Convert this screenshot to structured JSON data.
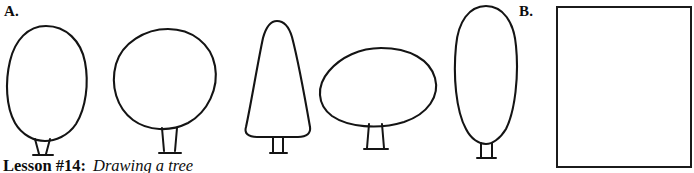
{
  "page": {
    "background_color": "#ffffff",
    "ink_color": "#141414"
  },
  "labels": {
    "part_a": "A.",
    "part_b": "B."
  },
  "caption": {
    "lesson": "Lesson #14:",
    "topic": "Drawing a tree"
  },
  "figure_a": {
    "name": "tree-shape-examples",
    "description": "Five hand-drawn tree canopy shapes with trunks",
    "trees": [
      {
        "id": "tree-1",
        "shape_name": "tall-egg-oval",
        "canopy_center_x": 46,
        "canopy_center_y": 82,
        "canopy_width": 74,
        "canopy_height": 112,
        "trunk_x": 42,
        "trunk_top_y": 136,
        "trunk_bottom_y": 155,
        "trunk_style": "flared"
      },
      {
        "id": "tree-2",
        "shape_name": "round-circle",
        "canopy_center_x": 168,
        "canopy_center_y": 80,
        "canopy_width": 94,
        "canopy_height": 100,
        "trunk_x": 169,
        "trunk_top_y": 128,
        "trunk_bottom_y": 153,
        "trunk_style": "flared"
      },
      {
        "id": "tree-3",
        "shape_name": "cone-conifer",
        "canopy_center_x": 277,
        "canopy_center_y": 80,
        "canopy_width": 68,
        "canopy_height": 120,
        "trunk_x": 278,
        "trunk_top_y": 134,
        "trunk_bottom_y": 153,
        "trunk_style": "straight"
      },
      {
        "id": "tree-4",
        "shape_name": "wide-flat-oval",
        "canopy_center_x": 378,
        "canopy_center_y": 87,
        "canopy_width": 116,
        "canopy_height": 78,
        "trunk_x": 375,
        "trunk_top_y": 126,
        "trunk_bottom_y": 150,
        "trunk_style": "flared"
      },
      {
        "id": "tree-5",
        "shape_name": "narrow-tall-ellipse",
        "canopy_center_x": 486,
        "canopy_center_y": 74,
        "canopy_width": 62,
        "canopy_height": 138,
        "trunk_x": 487,
        "trunk_top_y": 141,
        "trunk_bottom_y": 158,
        "trunk_style": "straight"
      }
    ]
  },
  "practice_box": {
    "name": "empty-practice-box",
    "border_color": "#1b1b1b",
    "fill_color": "#ffffff",
    "content": ""
  }
}
